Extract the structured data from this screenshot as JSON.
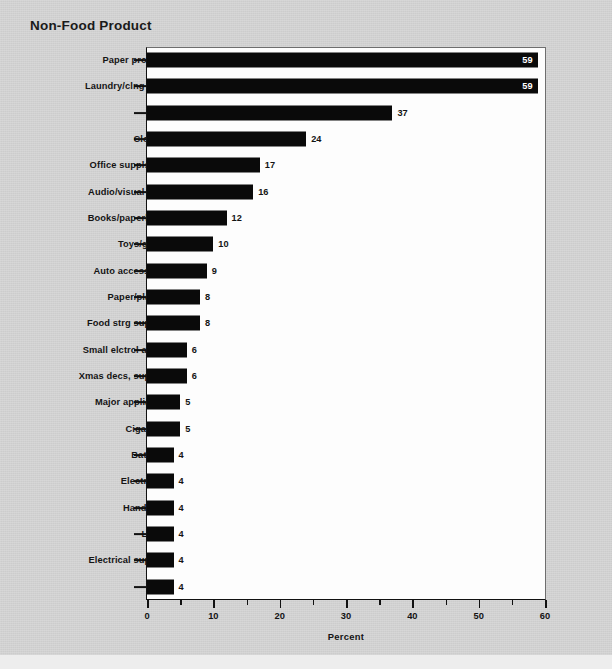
{
  "chart_data": {
    "type": "bar",
    "orientation": "horizontal",
    "title": "Non-Food Product",
    "xlabel": "Percent",
    "ylabel": "",
    "xlim": [
      0,
      60
    ],
    "xticks": [
      0,
      10,
      20,
      30,
      40,
      50,
      60
    ],
    "xticklabels": [
      "0",
      "10",
      "20",
      "30",
      "40",
      "50",
      "60"
    ],
    "xminorticks": [
      5,
      15,
      25,
      35,
      45,
      55
    ],
    "grid": false,
    "legend": null,
    "bar_color": "#0a0a0a",
    "plot_background": "#fdfdfd",
    "page_background": "#d4d4d4",
    "categories": [
      "Paper products",
      "Laundry/clng sppls",
      "HBA",
      "Clothing",
      "Office suppls/stny",
      "Audio/visual sppls",
      "Books/paperbacks",
      "Toys/games",
      "Auto accessories",
      "Paper/plastics",
      "Food strg supplies",
      "Small elctrcl applnc",
      "Xmas decs, supplies",
      "Major appliances",
      "Cigarettes",
      "Batteries",
      "Electronics",
      "Hand tools",
      "Linens",
      "Electrical supplies",
      "Tires"
    ],
    "values": [
      59,
      59,
      37,
      24,
      17,
      16,
      12,
      10,
      9,
      8,
      8,
      6,
      6,
      5,
      5,
      4,
      4,
      4,
      4,
      4,
      4
    ],
    "value_labels": [
      "59",
      "59",
      "37",
      "24",
      "17",
      "16",
      "12",
      "10",
      "9",
      "8",
      "8",
      "6",
      "6",
      "5",
      "5",
      "4",
      "4",
      "4",
      "4",
      "4",
      "4"
    ],
    "label_placement": [
      "inside",
      "inside",
      "outside",
      "outside",
      "outside",
      "outside",
      "outside",
      "outside",
      "outside",
      "outside",
      "outside",
      "outside",
      "outside",
      "outside",
      "outside",
      "outside",
      "outside",
      "outside",
      "outside",
      "outside",
      "outside"
    ]
  }
}
